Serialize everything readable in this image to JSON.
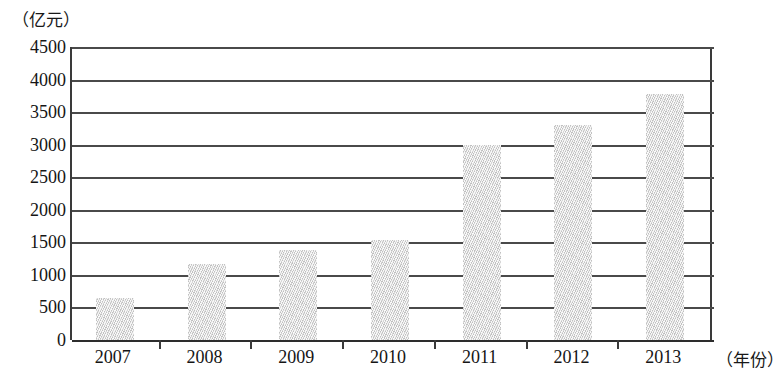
{
  "chart_data": {
    "type": "bar",
    "title": "",
    "subtitle": "",
    "xlabel": "（年份）",
    "ylabel": "（亿元）",
    "categories": [
      "2007",
      "2008",
      "2009",
      "2010",
      "2011",
      "2012",
      "2013"
    ],
    "values": [
      640,
      1170,
      1380,
      1540,
      3000,
      3300,
      3780
    ],
    "series": [
      {
        "name": "",
        "values": [
          640,
          1170,
          1380,
          1540,
          3000,
          3300,
          3780
        ]
      }
    ],
    "ylim": [
      0,
      4500
    ],
    "y_ticks": [
      0,
      500,
      1000,
      1500,
      2000,
      2500,
      3000,
      3500,
      4000,
      4500
    ],
    "y_tick_labels": [
      "0",
      "500",
      "1000",
      "1500",
      "2000",
      "2500",
      "3000",
      "3500",
      "4000",
      "4500"
    ],
    "x_tick_labels": [
      "2007",
      "2008",
      "2009",
      "2010",
      "2011",
      "2012",
      "2013"
    ],
    "grid": true,
    "legend": null,
    "legend_position": "none",
    "annotations": [],
    "bar_fill_color": "#d9d9d9",
    "axis_color": "#3a3a3a",
    "gridline_color": "#4a4a4a",
    "background_color": "#ffffff"
  },
  "axes": {
    "y_unit_caption": "（亿元）",
    "x_unit_caption": "（年份）"
  }
}
